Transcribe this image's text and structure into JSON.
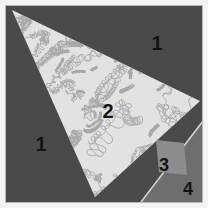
{
  "figure": {
    "canvas": {
      "width": 208,
      "height": 208
    },
    "border": {
      "color": "#f4f4f4",
      "inner_edge_color": "#b8b8b8",
      "thickness_px": 5
    },
    "palette": {
      "background_dark_gray": "#4a4a4a",
      "region2_light_fill": "#e2e2e2",
      "region2_texture_stroke": "#a9a9a9",
      "region3_mid_gray": "#8d8d8d",
      "region4_mid_gray": "#6e6e6e",
      "divider_line": "#d8d8d8",
      "label_color": "#141414"
    },
    "regions": [
      {
        "id": "region-1-upper",
        "label": "1",
        "label_x": 157,
        "label_y": 45,
        "font_size": 20,
        "fill": "#4a4a4a",
        "description": "dark gray background, upper right"
      },
      {
        "id": "region-1-left",
        "label": "1",
        "label_x": 41,
        "label_y": 146,
        "font_size": 20,
        "fill": "#4a4a4a",
        "description": "dark gray background, lower left"
      },
      {
        "id": "region-2",
        "label": "2",
        "label_x": 108,
        "label_y": 113,
        "font_size": 20,
        "fill": "#e2e2e2",
        "shape": "triangle",
        "points": "12,10 200,101 95,197",
        "description": "large light textured triangle"
      },
      {
        "id": "region-3",
        "label": "3",
        "label_x": 164,
        "label_y": 166,
        "font_size": 18,
        "fill": "#8d8d8d",
        "shape": "quadrilateral",
        "points": "156,140 184,143 187,175 159,172",
        "description": "mid gray rotated square"
      },
      {
        "id": "region-4",
        "label": "4",
        "label_x": 188,
        "label_y": 190,
        "font_size": 18,
        "fill": "#6e6e6e",
        "shape": "triangle",
        "points": "203,120 203,203 140,203",
        "description": "mid gray lower right wedge"
      }
    ],
    "divider": {
      "id": "region-4-divider",
      "from_x": 141,
      "from_y": 202,
      "to_x": 203,
      "to_y": 121,
      "color": "#d8d8d8"
    }
  }
}
